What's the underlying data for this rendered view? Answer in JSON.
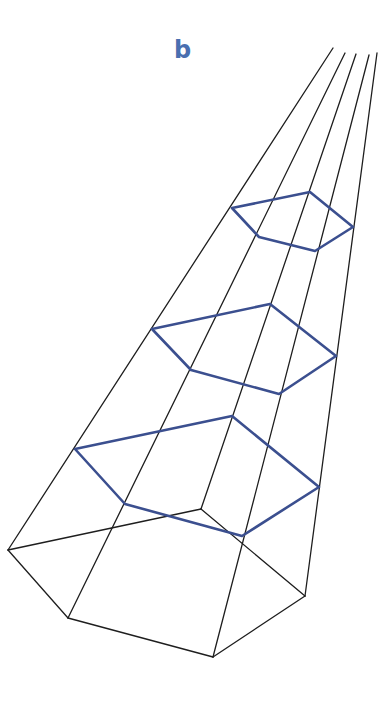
{
  "figure": {
    "panel_label": "b",
    "label_color": "#4a6fb0",
    "edge_color": "#1e1e1e",
    "section_color": "#3b4f8f",
    "base_pentagon": [
      [
        8,
        550
      ],
      [
        68,
        618
      ],
      [
        213,
        657
      ],
      [
        305,
        596
      ],
      [
        201,
        509
      ]
    ],
    "lateral_edges": [
      {
        "from": [
          8,
          550
        ],
        "to": [
          333,
          48
        ]
      },
      {
        "from": [
          68,
          618
        ],
        "to": [
          345,
          53
        ]
      },
      {
        "from": [
          213,
          657
        ],
        "to": [
          369,
          55
        ]
      },
      {
        "from": [
          305,
          596
        ],
        "to": [
          377,
          53
        ]
      },
      {
        "from": [
          201,
          509
        ],
        "to": [
          356,
          54
        ]
      }
    ],
    "sections": [
      {
        "name": "top-section",
        "points": [
          [
            232,
            208
          ],
          [
            310,
            192
          ],
          [
            353,
            227
          ],
          [
            315,
            251
          ],
          [
            259,
            237
          ]
        ]
      },
      {
        "name": "middle-section",
        "points": [
          [
            152,
            329
          ],
          [
            270,
            304
          ],
          [
            336,
            356
          ],
          [
            279,
            394
          ],
          [
            191,
            370
          ]
        ]
      },
      {
        "name": "lower-section",
        "points": [
          [
            75,
            449
          ],
          [
            232,
            416
          ],
          [
            319,
            487
          ],
          [
            242,
            536
          ],
          [
            125,
            504
          ]
        ]
      }
    ]
  }
}
